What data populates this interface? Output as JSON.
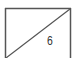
{
  "cell": {
    "label": "6",
    "border_color": "#555555",
    "diagonal": "bottom-left-to-top-right"
  }
}
